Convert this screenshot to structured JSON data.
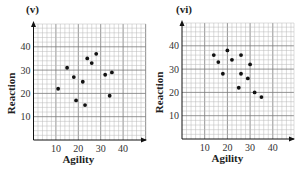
{
  "chart_data": [
    {
      "type": "scatter",
      "title": "(v)",
      "xlabel": "Agility",
      "ylabel": "Reaction",
      "xlim": [
        0,
        50
      ],
      "ylim": [
        0,
        50
      ],
      "xticks": [
        10,
        20,
        30,
        40
      ],
      "yticks": [
        10,
        20,
        30,
        40
      ],
      "grid": true,
      "minor_grid_step": 2,
      "legend": null,
      "points": [
        {
          "x": 11,
          "y": 22
        },
        {
          "x": 15,
          "y": 31
        },
        {
          "x": 18,
          "y": 27
        },
        {
          "x": 19,
          "y": 17
        },
        {
          "x": 22,
          "y": 25
        },
        {
          "x": 23,
          "y": 15
        },
        {
          "x": 24,
          "y": 35
        },
        {
          "x": 26,
          "y": 33
        },
        {
          "x": 28,
          "y": 37
        },
        {
          "x": 32,
          "y": 28
        },
        {
          "x": 34,
          "y": 19
        },
        {
          "x": 35,
          "y": 29
        }
      ]
    },
    {
      "type": "scatter",
      "title": "(vi)",
      "xlabel": "Agility",
      "ylabel": "Reaction",
      "xlim": [
        0,
        50
      ],
      "ylim": [
        0,
        50
      ],
      "xticks": [
        10,
        20,
        30,
        40
      ],
      "yticks": [
        10,
        20,
        30,
        40
      ],
      "grid": true,
      "minor_grid_step": 2,
      "legend": null,
      "points": [
        {
          "x": 14,
          "y": 36
        },
        {
          "x": 16,
          "y": 33
        },
        {
          "x": 18,
          "y": 28
        },
        {
          "x": 20,
          "y": 38
        },
        {
          "x": 22,
          "y": 34
        },
        {
          "x": 25,
          "y": 22
        },
        {
          "x": 26,
          "y": 36
        },
        {
          "x": 26,
          "y": 28
        },
        {
          "x": 29,
          "y": 26
        },
        {
          "x": 30,
          "y": 32
        },
        {
          "x": 32,
          "y": 20
        },
        {
          "x": 35,
          "y": 18
        }
      ]
    }
  ],
  "layout": {
    "panels": [
      {
        "ox": 33.5,
        "oy": 140,
        "sx": 2.24,
        "sy": 2.33,
        "right": 146,
        "top": 24,
        "label_x": 26,
        "label_y": 13
      },
      {
        "ox": 182,
        "oy": 139,
        "sx": 2.27,
        "sy": 2.33,
        "right": 294,
        "top": 23,
        "label_x": 176,
        "label_y": 13
      }
    ],
    "colors": {
      "grid_minor": "#b8b8b8",
      "grid_major": "#7a7a7a",
      "axis": "#111111",
      "point": "#111111"
    }
  }
}
